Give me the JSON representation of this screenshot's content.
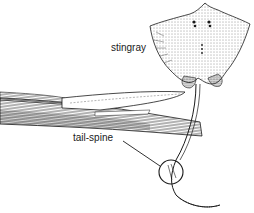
{
  "figure": {
    "subject": "stingray",
    "labels": [
      {
        "id": "stingray",
        "text": "stingray"
      },
      {
        "id": "tail-spine",
        "text": "tail-spine"
      }
    ]
  },
  "colors": {
    "ink": "#1a1a1a",
    "background": "#ffffff",
    "shade": "#555555"
  }
}
